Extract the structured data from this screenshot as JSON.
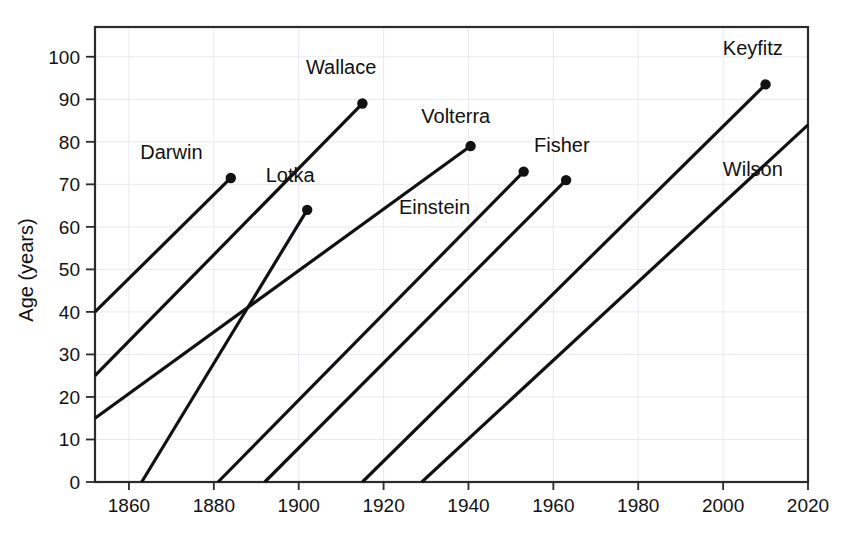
{
  "chart_data": {
    "type": "line",
    "title": "",
    "xlabel": "",
    "ylabel": "Age (years)",
    "xlim": [
      1852,
      2020
    ],
    "ylim": [
      0,
      107
    ],
    "xticks": [
      1860,
      1880,
      1900,
      1920,
      1940,
      1960,
      1980,
      2000,
      2020
    ],
    "xtick_labels": [
      "1860",
      "1880",
      "1900",
      "1920",
      "1940",
      "1960",
      "1980",
      "2000",
      "2020"
    ],
    "yticks": [
      0,
      10,
      20,
      30,
      40,
      50,
      60,
      70,
      80,
      90,
      100
    ],
    "ytick_labels": [
      "0",
      "10",
      "20",
      "30",
      "40",
      "50",
      "60",
      "70",
      "80",
      "90",
      "100"
    ],
    "grid": true,
    "legend": "none",
    "series": [
      {
        "name": "Darwin",
        "label": "Darwin",
        "birth_year": 1809,
        "death_year": 1884,
        "start": {
          "year": 1852,
          "age": 40
        },
        "end": {
          "year": 1884,
          "age": 71.5
        },
        "end_dot": true,
        "label_position": {
          "year": 1870,
          "age": 76
        },
        "label_anchor": "middle"
      },
      {
        "name": "Wallace",
        "label": "Wallace",
        "birth_year": 1823,
        "death_year": 1915,
        "start": {
          "year": 1852,
          "age": 25
        },
        "end": {
          "year": 1915,
          "age": 89
        },
        "end_dot": true,
        "label_position": {
          "year": 1910,
          "age": 96
        },
        "label_anchor": "middle"
      },
      {
        "name": "Volterra",
        "label": "Volterra",
        "birth_year": 1860,
        "death_year": 1940,
        "start": {
          "year": 1852,
          "age": 15
        },
        "end": {
          "year": 1940.5,
          "age": 79
        },
        "end_dot": true,
        "label_position": {
          "year": 1937,
          "age": 84.5
        },
        "label_anchor": "middle"
      },
      {
        "name": "Lotka",
        "label": "Lotka",
        "birth_year": 1863,
        "death_year": 1902,
        "start": {
          "year": 1863,
          "age": 0
        },
        "end": {
          "year": 1902,
          "age": 64
        },
        "end_dot": true,
        "label_position": {
          "year": 1898,
          "age": 70.5
        },
        "label_anchor": "middle"
      },
      {
        "name": "Einstein",
        "label": "Einstein",
        "birth_year": 1881,
        "death_year": 1953,
        "start": {
          "year": 1881,
          "age": 0
        },
        "end": {
          "year": 1953,
          "age": 73
        },
        "end_dot": true,
        "label_position": {
          "year": 1932,
          "age": 63
        },
        "label_anchor": "middle"
      },
      {
        "name": "Fisher",
        "label": "Fisher",
        "birth_year": 1892,
        "death_year": 1963,
        "start": {
          "year": 1892,
          "age": 0
        },
        "end": {
          "year": 1963,
          "age": 71
        },
        "end_dot": true,
        "label_position": {
          "year": 1962,
          "age": 77.5
        },
        "label_anchor": "middle"
      },
      {
        "name": "Keyfitz",
        "label": "Keyfitz",
        "birth_year": 1915,
        "death_year": 2010,
        "start": {
          "year": 1915,
          "age": 0
        },
        "end": {
          "year": 2010,
          "age": 93.5
        },
        "end_dot": true,
        "label_position": {
          "year": 2007,
          "age": 100.5
        },
        "label_anchor": "middle"
      },
      {
        "name": "Wilson",
        "label": "Wilson",
        "birth_year": 1929,
        "death_year": null,
        "start": {
          "year": 1929,
          "age": 0
        },
        "end": {
          "year": 2020,
          "age": 84
        },
        "end_dot": false,
        "label_position": {
          "year": 2007,
          "age": 72
        },
        "label_anchor": "middle"
      }
    ]
  },
  "axes": {
    "y_title": "Age (years)"
  }
}
